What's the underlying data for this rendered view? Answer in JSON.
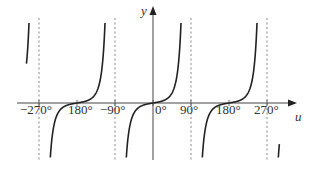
{
  "chart_data": {
    "type": "line",
    "title": "",
    "xlabel": "u",
    "ylabel": "y",
    "function_shape": "tangent-like curve, period 180°, vertical asymptotes at odd multiples of 90°, zero crossings at multiples of 180°",
    "x_ticks": [
      "−270°",
      "−180°",
      "−90°",
      "0°",
      "90°",
      "180°",
      "270°"
    ],
    "x_tick_values": [
      -270,
      -180,
      -90,
      0,
      90,
      180,
      270
    ],
    "asymptotes": [
      -270,
      -90,
      90,
      270
    ],
    "zeros": [
      -180,
      0,
      180
    ],
    "xlim": [
      -300,
      315
    ],
    "grid": false,
    "legend": null,
    "series": [
      {
        "name": "y",
        "branches": [
          {
            "u_range": [
              -300,
              -270
            ]
          },
          {
            "u_range": [
              -270,
              -90
            ]
          },
          {
            "u_range": [
              -90,
              90
            ]
          },
          {
            "u_range": [
              90,
              270
            ]
          },
          {
            "u_range": [
              270,
              300
            ]
          }
        ]
      }
    ]
  },
  "labels": {
    "y_axis": "y",
    "u_axis": "u",
    "ticks": [
      "−270°",
      "180°",
      "−90°",
      "0°",
      "90°",
      "180°",
      "270°"
    ]
  },
  "colors": {
    "curve": "#222222",
    "axis": "#444444",
    "asymptote": "#888888",
    "text": "#333333"
  }
}
